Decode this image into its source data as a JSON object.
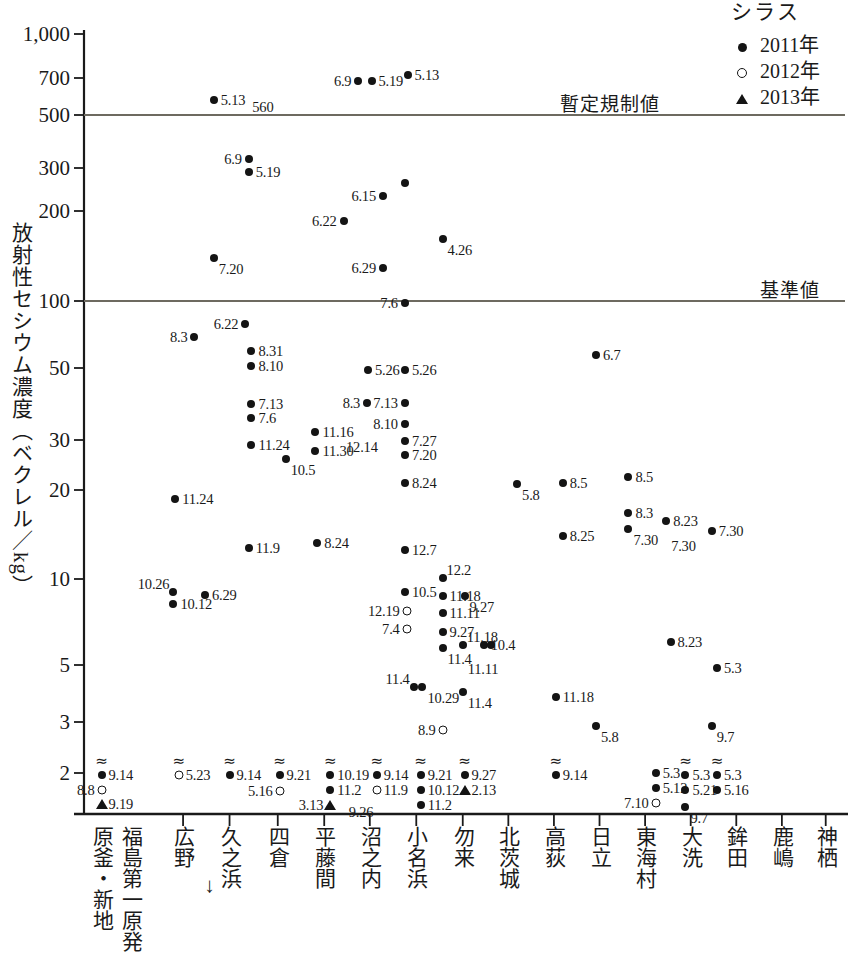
{
  "chart_data": {
    "type": "scatter",
    "title": "",
    "ylabel": "放射性セシウム濃度（ベクレル／kg）",
    "xlabel": "",
    "yscale": "log",
    "ylim": [
      1.8,
      1000
    ],
    "yticks": [
      "1,000",
      "700",
      "500",
      "300",
      "200",
      "100",
      "50",
      "30",
      "20",
      "10",
      "5",
      "3",
      "2"
    ],
    "ytick_values": [
      1000,
      700,
      500,
      300,
      200,
      100,
      50,
      30,
      20,
      10,
      5,
      3,
      2
    ],
    "grid": false,
    "legend_position": "top-right",
    "legend_title": "シラス",
    "legend": [
      {
        "label": "2011年",
        "marker": "filled-circle"
      },
      {
        "label": "2012年",
        "marker": "open-circle"
      },
      {
        "label": "2013年",
        "marker": "filled-triangle"
      }
    ],
    "reference_lines": [
      {
        "label": "暫定規制値",
        "value": 500
      },
      {
        "label": "基準値",
        "value": 100
      }
    ],
    "categories": [
      "原釜・新地",
      "福島第一原発",
      "広野",
      "久之浜",
      "四倉",
      "平藤間",
      "沼之内",
      "小名浜",
      "勿来",
      "北茨城",
      "高荻",
      "日立",
      "東海村",
      "大洗",
      "鉾田",
      "鹿嶋",
      "神栖"
    ],
    "annotations": [
      {
        "text": "560",
        "note": "value label next to 5.13 point at Hirono"
      },
      {
        "text": "↑",
        "note": "arrow marking Fukushima Daiichi plant position"
      }
    ],
    "points": [
      {
        "x": 104,
        "y": 775,
        "series": "2011年",
        "label": "9.14",
        "label_side": "right",
        "approx": true
      },
      {
        "x": 104,
        "y": 790,
        "series": "2012年",
        "label": "8.8",
        "label_side": "left",
        "approx": false
      },
      {
        "x": 104,
        "y": 804,
        "series": "2013年",
        "label": "9.19",
        "label_side": "right",
        "approx": false
      },
      {
        "x": 232,
        "y": 100,
        "series": "2011年",
        "label": "5.13",
        "label_side": "right",
        "approx": false
      },
      {
        "x": 268,
        "y": 107,
        "series": "none",
        "label": "560",
        "label_side": "right",
        "approx": false
      },
      {
        "x": 232,
        "y": 258,
        "series": "2011年",
        "label": "7.20",
        "label_side": "bottom-right",
        "approx": false
      },
      {
        "x": 210,
        "y": 337,
        "series": "2011年",
        "label": "8.3",
        "label_side": "left",
        "approx": false
      },
      {
        "x": 188,
        "y": 499,
        "series": "2011年",
        "label": "11.24",
        "label_side": "right",
        "approx": false
      },
      {
        "x": 186,
        "y": 592,
        "series": "2011年",
        "label": "10.26",
        "label_side": "top-left",
        "approx": false
      },
      {
        "x": 186,
        "y": 604,
        "series": "2011年",
        "label": "10.12",
        "label_side": "right",
        "approx": false
      },
      {
        "x": 192,
        "y": 775,
        "series": "2012年",
        "label": "5.23",
        "label_side": "right",
        "approx": true
      },
      {
        "x": 268,
        "y": 324,
        "series": "2011年",
        "label": "6.22",
        "label_side": "left",
        "approx": false
      },
      {
        "x": 222,
        "y": 595,
        "series": "2011年",
        "label": "6.29",
        "label_side": "right",
        "approx": false
      },
      {
        "x": 250,
        "y": 775,
        "series": "2011年",
        "label": "9.14",
        "label_side": "right",
        "approx": true
      },
      {
        "x": 272,
        "y": 159,
        "series": "2011年",
        "label": "6.9",
        "label_side": "left",
        "approx": false
      },
      {
        "x": 272,
        "y": 172,
        "series": "2011年",
        "label": "5.19",
        "label_side": "right",
        "approx": false
      },
      {
        "x": 275,
        "y": 351,
        "series": "2011年",
        "label": "8.31",
        "label_side": "right",
        "approx": false
      },
      {
        "x": 275,
        "y": 366,
        "series": "2011年",
        "label": "8.10",
        "label_side": "right",
        "approx": false
      },
      {
        "x": 275,
        "y": 404,
        "series": "2011年",
        "label": "7.13",
        "label_side": "right",
        "approx": false
      },
      {
        "x": 275,
        "y": 418,
        "series": "2011年",
        "label": "7.6",
        "label_side": "right",
        "approx": false
      },
      {
        "x": 275,
        "y": 445,
        "series": "2011年",
        "label": "11.24",
        "label_side": "right",
        "approx": false
      },
      {
        "x": 272,
        "y": 548,
        "series": "2011年",
        "label": "11.9",
        "label_side": "right",
        "approx": false
      },
      {
        "x": 307,
        "y": 775,
        "series": "2011年",
        "label": "9.21",
        "label_side": "right",
        "approx": true
      },
      {
        "x": 307,
        "y": 791,
        "series": "2012年",
        "label": "5.16",
        "label_side": "left",
        "approx": false
      },
      {
        "x": 314,
        "y": 459,
        "series": "2011年",
        "label": "10.5",
        "label_side": "bottom-right",
        "approx": false
      },
      {
        "x": 380,
        "y": 221,
        "series": "2011年",
        "label": "6.22",
        "label_side": "left",
        "approx": false
      },
      {
        "x": 348,
        "y": 432,
        "series": "2011年",
        "label": "11.16",
        "label_side": "right",
        "approx": false
      },
      {
        "x": 348,
        "y": 451,
        "series": "2011年",
        "label": "11.30",
        "label_side": "right",
        "approx": false
      },
      {
        "x": 350,
        "y": 543,
        "series": "2011年",
        "label": "8.24",
        "label_side": "right",
        "approx": false
      },
      {
        "x": 365,
        "y": 775,
        "series": "2011年",
        "label": "10.19",
        "label_side": "right",
        "approx": true
      },
      {
        "x": 365,
        "y": 790,
        "series": "2011年",
        "label": "11.2",
        "label_side": "right",
        "approx": false
      },
      {
        "x": 365,
        "y": 805,
        "series": "2013年",
        "label": "3.13",
        "label_side": "left",
        "approx": false
      },
      {
        "x": 378,
        "y": 812,
        "series": "none",
        "label": "9.26",
        "label_side": "right",
        "approx": false
      },
      {
        "x": 408,
        "y": 370,
        "series": "2011年",
        "label": "5.26",
        "label_side": "right",
        "approx": false
      },
      {
        "x": 407,
        "y": 403,
        "series": "2011年",
        "label": "8.3",
        "label_side": "left",
        "approx": false
      },
      {
        "x": 418,
        "y": 775,
        "series": "2011年",
        "label": "9.14",
        "label_side": "right",
        "approx": true
      },
      {
        "x": 418,
        "y": 790,
        "series": "2012年",
        "label": "11.9",
        "label_side": "right",
        "approx": false
      },
      {
        "x": 425,
        "y": 196,
        "series": "2011年",
        "label": "6.15",
        "label_side": "left",
        "approx": false
      },
      {
        "x": 450,
        "y": 183,
        "series": "2011年",
        "label": "5.13",
        "label_side": "none",
        "approx": false
      },
      {
        "x": 453,
        "y": 75,
        "series": "2011年",
        "label": "5.13",
        "label_side": "right",
        "approx": false
      },
      {
        "x": 397,
        "y": 81,
        "series": "2011年",
        "label": "6.9",
        "label_side": "left",
        "approx": false
      },
      {
        "x": 412,
        "y": 81,
        "series": "2011年",
        "label": "5.19",
        "label_side": "right",
        "approx": false
      },
      {
        "x": 425,
        "y": 268,
        "series": "2011年",
        "label": "6.29",
        "label_side": "left",
        "approx": false
      },
      {
        "x": 450,
        "y": 303,
        "series": "2011年",
        "label": "7.6",
        "label_side": "left",
        "approx": false
      },
      {
        "x": 450,
        "y": 370,
        "series": "2011年",
        "label": "5.26",
        "label_side": "right",
        "approx": false
      },
      {
        "x": 450,
        "y": 403,
        "series": "2011年",
        "label": "7.13",
        "label_side": "left",
        "approx": false
      },
      {
        "x": 450,
        "y": 424,
        "series": "2011年",
        "label": "8.10",
        "label_side": "left",
        "approx": false
      },
      {
        "x": 450,
        "y": 441,
        "series": "2011年",
        "label": "7.27",
        "label_side": "right",
        "approx": false
      },
      {
        "x": 450,
        "y": 455,
        "series": "2011年",
        "label": "7.20",
        "label_side": "right",
        "approx": false
      },
      {
        "x": 427,
        "y": 447,
        "series": "none",
        "label": "12.14",
        "label_side": "left",
        "approx": false
      },
      {
        "x": 450,
        "y": 483,
        "series": "2011年",
        "label": "8.24",
        "label_side": "right",
        "approx": false
      },
      {
        "x": 450,
        "y": 550,
        "series": "2011年",
        "label": "12.7",
        "label_side": "right",
        "approx": false
      },
      {
        "x": 450,
        "y": 592,
        "series": "2011年",
        "label": "10.5",
        "label_side": "right",
        "approx": false
      },
      {
        "x": 452,
        "y": 611,
        "series": "2012年",
        "label": "12.19",
        "label_side": "left",
        "approx": false
      },
      {
        "x": 452,
        "y": 629,
        "series": "2012年",
        "label": "7.4",
        "label_side": "left",
        "approx": false
      },
      {
        "x": 460,
        "y": 687,
        "series": "2011年",
        "label": "11.4",
        "label_side": "top-left",
        "approx": false
      },
      {
        "x": 470,
        "y": 687,
        "series": "2011年",
        "label": "10.29",
        "label_side": "bottom-right",
        "approx": false
      },
      {
        "x": 468,
        "y": 775,
        "series": "2011年",
        "label": "9.21",
        "label_side": "right",
        "approx": true
      },
      {
        "x": 468,
        "y": 790,
        "series": "2011年",
        "label": "10.12",
        "label_side": "right",
        "approx": false
      },
      {
        "x": 468,
        "y": 805,
        "series": "2011年",
        "label": "11.2",
        "label_side": "right",
        "approx": false
      },
      {
        "x": 493,
        "y": 239,
        "series": "2011年",
        "label": "4.26",
        "label_side": "bottom-right",
        "approx": false
      },
      {
        "x": 493,
        "y": 578,
        "series": "2011年",
        "label": "12.2",
        "label_side": "top-right",
        "approx": false
      },
      {
        "x": 493,
        "y": 596,
        "series": "2011年",
        "label": "11.18",
        "label_side": "right",
        "approx": false
      },
      {
        "x": 493,
        "y": 613,
        "series": "2011年",
        "label": "11.11",
        "label_side": "right",
        "approx": false
      },
      {
        "x": 493,
        "y": 632,
        "series": "2011年",
        "label": "9.27",
        "label_side": "right",
        "approx": false
      },
      {
        "x": 493,
        "y": 648,
        "series": "2011年",
        "label": "11.4",
        "label_side": "bottom-right",
        "approx": false
      },
      {
        "x": 518,
        "y": 596,
        "series": "2011年",
        "label": "9.27",
        "label_side": "bottom-right",
        "approx": false
      },
      {
        "x": 516,
        "y": 645,
        "series": "2011年",
        "label": "11.18",
        "label_side": "top-right",
        "approx": false
      },
      {
        "x": 516,
        "y": 658,
        "series": "none",
        "label": "11.11",
        "label_side": "bottom-right",
        "approx": false
      },
      {
        "x": 540,
        "y": 645,
        "series": "2011年",
        "label": "10.4",
        "label_side": "right",
        "approx": false
      },
      {
        "x": 548,
        "y": 645,
        "series": "2011年",
        "label": "",
        "label_side": "none",
        "approx": false
      },
      {
        "x": 516,
        "y": 692,
        "series": "2011年",
        "label": "11.4",
        "label_side": "bottom-right",
        "approx": false
      },
      {
        "x": 493,
        "y": 730,
        "series": "2012年",
        "label": "8.9",
        "label_side": "left",
        "approx": false
      },
      {
        "x": 518,
        "y": 775,
        "series": "2011年",
        "label": "9.27",
        "label_side": "right",
        "approx": true
      },
      {
        "x": 518,
        "y": 790,
        "series": "2013年",
        "label": "2.13",
        "label_side": "right",
        "approx": false
      },
      {
        "x": 578,
        "y": 484,
        "series": "2011年",
        "label": "5.8",
        "label_side": "bottom-right",
        "approx": false
      },
      {
        "x": 630,
        "y": 483,
        "series": "2011年",
        "label": "8.5",
        "label_side": "right",
        "approx": false
      },
      {
        "x": 630,
        "y": 536,
        "series": "2011年",
        "label": "8.25",
        "label_side": "right",
        "approx": false
      },
      {
        "x": 622,
        "y": 697,
        "series": "2011年",
        "label": "11.18",
        "label_side": "right",
        "approx": false
      },
      {
        "x": 622,
        "y": 775,
        "series": "2011年",
        "label": "9.14",
        "label_side": "right",
        "approx": true
      },
      {
        "x": 668,
        "y": 355,
        "series": "2011年",
        "label": "6.7",
        "label_side": "right",
        "approx": false
      },
      {
        "x": 668,
        "y": 726,
        "series": "2011年",
        "label": "5.8",
        "label_side": "bottom-right",
        "approx": false
      },
      {
        "x": 705,
        "y": 477,
        "series": "2011年",
        "label": "8.5",
        "label_side": "right",
        "approx": false
      },
      {
        "x": 705,
        "y": 513,
        "series": "2011年",
        "label": "8.3",
        "label_side": "right",
        "approx": false
      },
      {
        "x": 705,
        "y": 529,
        "series": "2011年",
        "label": "7.30",
        "label_side": "bottom-right",
        "approx": false
      },
      {
        "x": 736,
        "y": 773,
        "series": "2011年",
        "label": "5.3",
        "label_side": "right",
        "approx": false
      },
      {
        "x": 736,
        "y": 788,
        "series": "2011年",
        "label": "5.12",
        "label_side": "right",
        "approx": false
      },
      {
        "x": 736,
        "y": 803,
        "series": "2012年",
        "label": "7.10",
        "label_side": "left",
        "approx": false
      },
      {
        "x": 748,
        "y": 521,
        "series": "2011年",
        "label": "8.23",
        "label_side": "right",
        "approx": false
      },
      {
        "x": 748,
        "y": 535,
        "series": "none",
        "label": "7.30",
        "label_side": "bottom-right",
        "approx": false
      },
      {
        "x": 753,
        "y": 642,
        "series": "2011年",
        "label": "8.23",
        "label_side": "right",
        "approx": false
      },
      {
        "x": 770,
        "y": 775,
        "series": "2011年",
        "label": "5.3",
        "label_side": "right",
        "approx": true
      },
      {
        "x": 770,
        "y": 790,
        "series": "2011年",
        "label": "5.21",
        "label_side": "right",
        "approx": false
      },
      {
        "x": 770,
        "y": 807,
        "series": "2011年",
        "label": "9.7",
        "label_side": "bottom-right",
        "approx": false
      },
      {
        "x": 800,
        "y": 531,
        "series": "2011年",
        "label": "7.30",
        "label_side": "right",
        "approx": false
      },
      {
        "x": 806,
        "y": 668,
        "series": "2011年",
        "label": "5.3",
        "label_side": "right",
        "approx": false
      },
      {
        "x": 800,
        "y": 726,
        "series": "2011年",
        "label": "9.7",
        "label_side": "bottom-right",
        "approx": false
      },
      {
        "x": 806,
        "y": 775,
        "series": "2011年",
        "label": "5.3",
        "label_side": "right",
        "approx": true
      },
      {
        "x": 806,
        "y": 790,
        "series": "2011年",
        "label": "5.16",
        "label_side": "right",
        "approx": false
      }
    ]
  },
  "axis": {
    "y_title": "放射性セシウム濃度（ベクレル／kg）",
    "ticks": [
      {
        "label": "1,000",
        "py": 34
      },
      {
        "label": "700",
        "py": 78
      },
      {
        "label": "500",
        "py": 115
      },
      {
        "label": "300",
        "py": 168
      },
      {
        "label": "200",
        "py": 211
      },
      {
        "label": "100",
        "py": 301
      },
      {
        "label": "50",
        "py": 368
      },
      {
        "label": "30",
        "py": 440
      },
      {
        "label": "20",
        "py": 490
      },
      {
        "label": "10",
        "py": 579
      },
      {
        "label": "5",
        "py": 665
      },
      {
        "label": "3",
        "py": 722
      },
      {
        "label": "2",
        "py": 773
      }
    ]
  },
  "categories_layout": [
    {
      "label": "原釜・新地",
      "px": 104,
      "tick": false
    },
    {
      "label": "福島第一原発",
      "px": 150,
      "tick": false,
      "arrow": "↑"
    },
    {
      "label": "広野",
      "px": 197,
      "tick": true
    },
    {
      "label": "久之浜",
      "px": 250,
      "tick": true
    },
    {
      "label": "四倉",
      "px": 305,
      "tick": true
    },
    {
      "label": "平藤間",
      "px": 358,
      "tick": true
    },
    {
      "label": "沼之内",
      "px": 410,
      "tick": true
    },
    {
      "label": "小名浜",
      "px": 463,
      "tick": true
    },
    {
      "label": "勿来",
      "px": 516,
      "tick": true
    },
    {
      "label": "北茨城",
      "px": 568,
      "tick": true
    },
    {
      "label": "高荻",
      "px": 620,
      "tick": true
    },
    {
      "label": "日立",
      "px": 672,
      "tick": true
    },
    {
      "label": "東海村",
      "px": 724,
      "tick": true
    },
    {
      "label": "大洗",
      "px": 776,
      "tick": true
    },
    {
      "label": "鉾田",
      "px": 828,
      "tick": true
    },
    {
      "label": "鹿嶋",
      "px": 880,
      "tick": true
    },
    {
      "label": "神栖",
      "px": 930,
      "tick": true
    }
  ],
  "reference_lines_layout": [
    {
      "label": "暫定規制値",
      "py": 115,
      "label_x": 560
    },
    {
      "label": "基準値",
      "py": 301,
      "label_x": 760
    }
  ],
  "legend": {
    "title": "シラス",
    "items": [
      {
        "marker": "filled-circle",
        "label": "2011年"
      },
      {
        "marker": "open-circle",
        "label": "2012年"
      },
      {
        "marker": "filled-triangle",
        "label": "2013年"
      }
    ]
  }
}
